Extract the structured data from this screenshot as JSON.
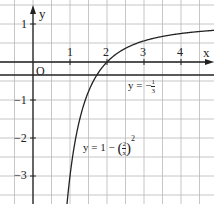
{
  "chart_data": {
    "type": "line",
    "title": "",
    "xlabel": "x",
    "ylabel": "y",
    "origin_label": "O",
    "xlim": [
      -0.9,
      4.9
    ],
    "ylim": [
      -3.8,
      1.6
    ],
    "grid": true,
    "grid_step": 0.5,
    "x_ticks": [
      "1",
      "2",
      "3",
      "4"
    ],
    "y_ticks": [
      "1",
      "-1",
      "-2",
      "-3"
    ],
    "series": [
      {
        "name": "y = 1 - (2/x)^2",
        "formula": "1 - (2/x)^2",
        "x": [
          0.9,
          1.0,
          1.25,
          1.5,
          1.75,
          2.0,
          2.5,
          3.0,
          3.5,
          4.0,
          4.9
        ],
        "values": [
          -3.94,
          -3.0,
          -1.56,
          -0.78,
          -0.31,
          0.0,
          0.36,
          0.56,
          0.67,
          0.75,
          0.83
        ]
      },
      {
        "name": "y = -1/3",
        "formula": "-1/3",
        "x": [
          -0.9,
          4.9
        ],
        "values": [
          -0.333,
          -0.333
        ]
      }
    ],
    "annotations": [
      {
        "text": "y = -1/3",
        "at": [
          2.5,
          -0.6
        ]
      },
      {
        "text": "y = 1 - (2/x)^2",
        "at": [
          1.1,
          -2.0
        ]
      }
    ]
  },
  "labels": {
    "x_axis": "x",
    "y_axis": "y",
    "origin": "O",
    "tick_x1": "1",
    "tick_x2": "2",
    "tick_x3": "3",
    "tick_x4": "4",
    "tick_y1": "1",
    "tick_ym1": "−1",
    "tick_ym2": "−2",
    "tick_ym3": "−3",
    "line_label_prefix": "y = −",
    "line_label_num": "1",
    "line_label_den": "3",
    "curve_label_prefix": "y = 1 − ",
    "curve_label_num": "2",
    "curve_label_den": "x",
    "curve_label_exp": "2"
  },
  "colors": {
    "grid": "#b8b8b8",
    "axis": "#222222",
    "curve": "#222222"
  }
}
